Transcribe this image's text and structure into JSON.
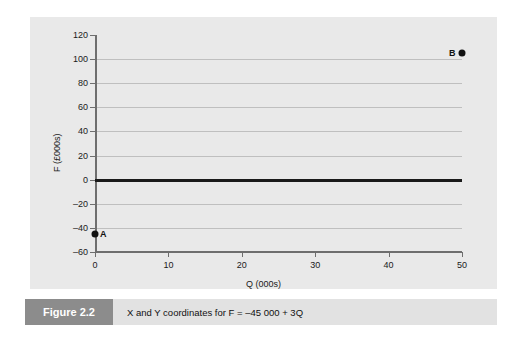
{
  "caption": {
    "figure_number": "Figure 2.2",
    "text": "X and Y coordinates for F = –45 000 + 3Q"
  },
  "chart_data": {
    "type": "scatter",
    "title": "",
    "xlabel": "Q (000s)",
    "ylabel": "F (£000s)",
    "xlim": [
      0,
      50
    ],
    "ylim": [
      -60,
      120
    ],
    "xticks": [
      "0",
      "10",
      "20",
      "30",
      "40",
      "50"
    ],
    "xtick_values": [
      0,
      10,
      20,
      30,
      40,
      50
    ],
    "yticks": [
      "120",
      "100",
      "80",
      "60",
      "40",
      "20",
      "0",
      "–20",
      "–40",
      "–60"
    ],
    "ytick_values": [
      120,
      100,
      80,
      60,
      40,
      20,
      0,
      -20,
      -40,
      -60
    ],
    "gridlines_y": [
      100,
      80,
      60,
      40,
      20,
      -20,
      -40
    ],
    "grid": true,
    "zero_line": 0,
    "legend": "none",
    "points": [
      {
        "label": "A",
        "x": 0,
        "y": -45,
        "label_side": "right"
      },
      {
        "label": "B",
        "x": 50,
        "y": 105,
        "label_side": "left"
      }
    ]
  },
  "colors": {
    "panel_background": "#e9e9e9",
    "page_background": "#ffffff",
    "gridline": "#bfbfbf",
    "axis": "#6e6e6e",
    "zero_line": "#1a1a1a",
    "point": "#111111",
    "figure_number_block": "#8c8c8c",
    "caption_block": "#e2e2e2"
  }
}
